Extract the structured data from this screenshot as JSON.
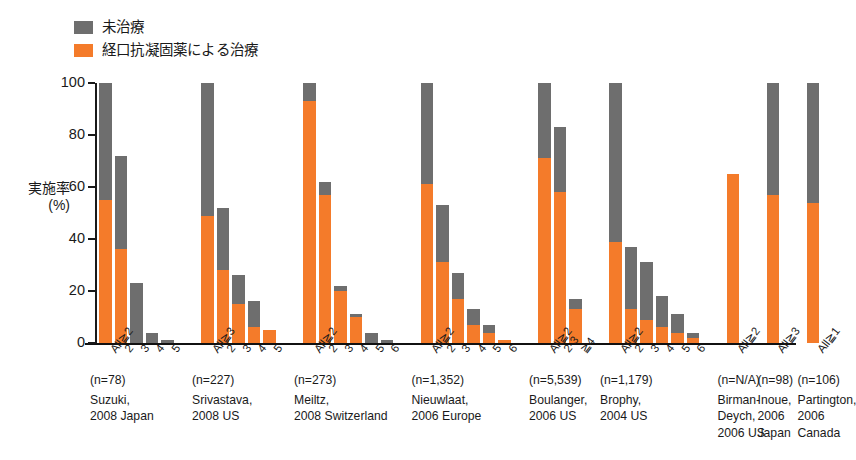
{
  "legend": {
    "items": [
      {
        "label": "未治療",
        "color": "#6e6e6e",
        "icon": "gray-square-swatch"
      },
      {
        "label": "経口抗凝固薬による治療",
        "color": "#f47b2a",
        "icon": "orange-square-swatch"
      }
    ]
  },
  "axis": {
    "y_title_lines": [
      "実施率",
      "(%)"
    ],
    "y_ticks": [
      "0",
      "20",
      "40",
      "60",
      "80",
      "100"
    ]
  },
  "chart_data": {
    "type": "bar",
    "subtype": "stacked",
    "title": "",
    "xlabel": "",
    "ylabel": "実施率 (%)",
    "ylim": [
      0,
      100
    ],
    "grid": false,
    "legend_position": "top-left",
    "series": [
      {
        "name": "経口抗凝固薬による治療",
        "color": "#f47b2a"
      },
      {
        "name": "未治療",
        "color": "#6e6e6e"
      }
    ],
    "groups": [
      {
        "study": "Suzuki,",
        "year_country": "2008 Japan",
        "n": "(n=78)",
        "bars": [
          {
            "category": "All≧2",
            "total": 100,
            "treated": 55,
            "untreated": 45
          },
          {
            "category": "2",
            "total": 72,
            "treated": 36,
            "untreated": 36
          },
          {
            "category": "3",
            "total": 23,
            "treated": 0,
            "untreated": 23
          },
          {
            "category": "4",
            "total": 4,
            "treated": 0,
            "untreated": 4
          },
          {
            "category": "5",
            "total": 1,
            "treated": 0,
            "untreated": 1
          }
        ]
      },
      {
        "study": "Srivastava,",
        "year_country": "2008 US",
        "n": "(n=227)",
        "bars": [
          {
            "category": "All≧3",
            "total": 100,
            "treated": 49,
            "untreated": 51
          },
          {
            "category": "2",
            "total": 52,
            "treated": 28,
            "untreated": 24
          },
          {
            "category": "3",
            "total": 26,
            "treated": 15,
            "untreated": 11
          },
          {
            "category": "4",
            "total": 16,
            "treated": 6,
            "untreated": 10
          },
          {
            "category": "5",
            "total": 5,
            "treated": 5,
            "untreated": 0
          }
        ]
      },
      {
        "study": "Meiltz,",
        "year_country": "2008 Switzerland",
        "n": "(n=273)",
        "bars": [
          {
            "category": "All≧2",
            "total": 100,
            "treated": 93,
            "untreated": 7
          },
          {
            "category": "2",
            "total": 62,
            "treated": 57,
            "untreated": 5
          },
          {
            "category": "3",
            "total": 22,
            "treated": 20,
            "untreated": 2
          },
          {
            "category": "4",
            "total": 11,
            "treated": 10,
            "untreated": 1
          },
          {
            "category": "5",
            "total": 4,
            "treated": 0,
            "untreated": 4
          },
          {
            "category": "6",
            "total": 1,
            "treated": 0,
            "untreated": 1
          }
        ]
      },
      {
        "study": "Nieuwlaat,",
        "year_country": "2006 Europe",
        "n": "(n=1,352)",
        "bars": [
          {
            "category": "All≧2",
            "total": 100,
            "treated": 61,
            "untreated": 39
          },
          {
            "category": "2",
            "total": 53,
            "treated": 31,
            "untreated": 22
          },
          {
            "category": "3",
            "total": 27,
            "treated": 17,
            "untreated": 10
          },
          {
            "category": "4",
            "total": 13,
            "treated": 7,
            "untreated": 6
          },
          {
            "category": "5",
            "total": 7,
            "treated": 4,
            "untreated": 3
          },
          {
            "category": "6",
            "total": 1,
            "treated": 1,
            "untreated": 0
          }
        ]
      },
      {
        "study": "Boulanger,",
        "year_country": "2006 US",
        "n": "(n=5,539)",
        "bars": [
          {
            "category": "All≧2",
            "total": 100,
            "treated": 71,
            "untreated": 29
          },
          {
            "category": "2-3",
            "total": 83,
            "treated": 58,
            "untreated": 25
          },
          {
            "category": "≧4",
            "total": 17,
            "treated": 13,
            "untreated": 4
          }
        ]
      },
      {
        "study": "Brophy,",
        "year_country": "2004 US",
        "n": "(n=1,179)",
        "bars": [
          {
            "category": "All≧2",
            "total": 100,
            "treated": 39,
            "untreated": 61
          },
          {
            "category": "2",
            "total": 37,
            "treated": 13,
            "untreated": 24
          },
          {
            "category": "3",
            "total": 31,
            "treated": 9,
            "untreated": 22
          },
          {
            "category": "4",
            "total": 18,
            "treated": 6,
            "untreated": 12
          },
          {
            "category": "5",
            "total": 11,
            "treated": 4,
            "untreated": 7
          },
          {
            "category": "6",
            "total": 4,
            "treated": 2,
            "untreated": 2
          }
        ]
      },
      {
        "study": "Birman-",
        "study2": "Deych,",
        "year_country": "2006 US",
        "n": "(n=N/A)",
        "bars": [
          {
            "category": "All≧2",
            "total": 65,
            "treated": 65,
            "untreated": 0
          }
        ]
      },
      {
        "study": "Inoue,",
        "year_country": "2006",
        "year_country2": "Japan",
        "n": "(n=98)",
        "bars": [
          {
            "category": "All≧3",
            "total": 100,
            "treated": 57,
            "untreated": 43
          }
        ]
      },
      {
        "study": "Partington,",
        "year_country": "2006",
        "year_country2": "Canada",
        "n": "(n=106)",
        "bars": [
          {
            "category": "All≧1",
            "total": 100,
            "treated": 54,
            "untreated": 46
          }
        ]
      }
    ]
  }
}
